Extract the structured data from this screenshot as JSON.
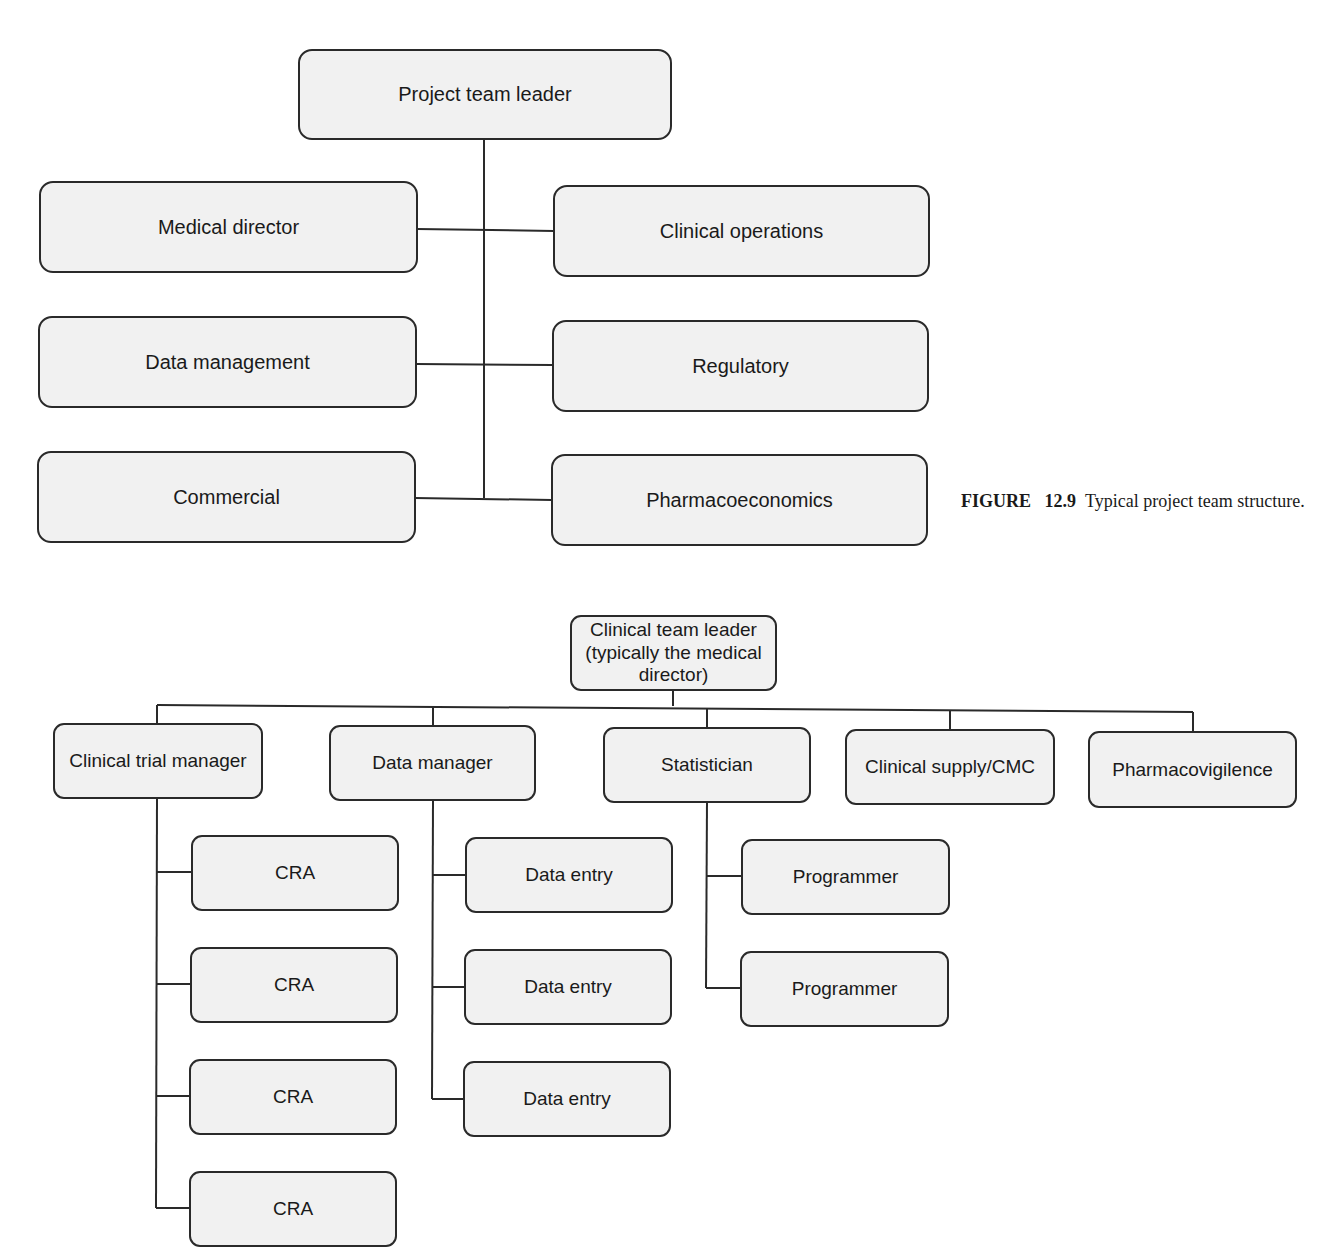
{
  "figure": {
    "label": "FIGURE",
    "number": "12.9",
    "caption": "Typical project team structure."
  },
  "project_team": {
    "leader": "Project team leader",
    "left_members": [
      "Medical director",
      "Data management",
      "Commercial"
    ],
    "right_members": [
      "Clinical operations",
      "Regulatory",
      "Pharmacoeconomics"
    ]
  },
  "clinical_team": {
    "leader": "Clinical team leader (typically the medical director)",
    "leader_lines": [
      "Clinical team leader",
      "(typically the medical",
      "director)"
    ],
    "branches": [
      {
        "label": "Clinical trial manager",
        "children": [
          "CRA",
          "CRA",
          "CRA",
          "CRA"
        ]
      },
      {
        "label": "Data manager",
        "children": [
          "Data entry",
          "Data entry",
          "Data entry"
        ]
      },
      {
        "label": "Statistician",
        "children": [
          "Programmer",
          "Programmer"
        ]
      },
      {
        "label": "Clinical supply/CMC",
        "children": []
      },
      {
        "label": "Pharmacovigilence",
        "children": []
      }
    ]
  },
  "colors": {
    "box_fill": "#f1f1f1",
    "box_border": "#2a2a2a",
    "line": "#2a2a2a",
    "background": "#ffffff"
  }
}
